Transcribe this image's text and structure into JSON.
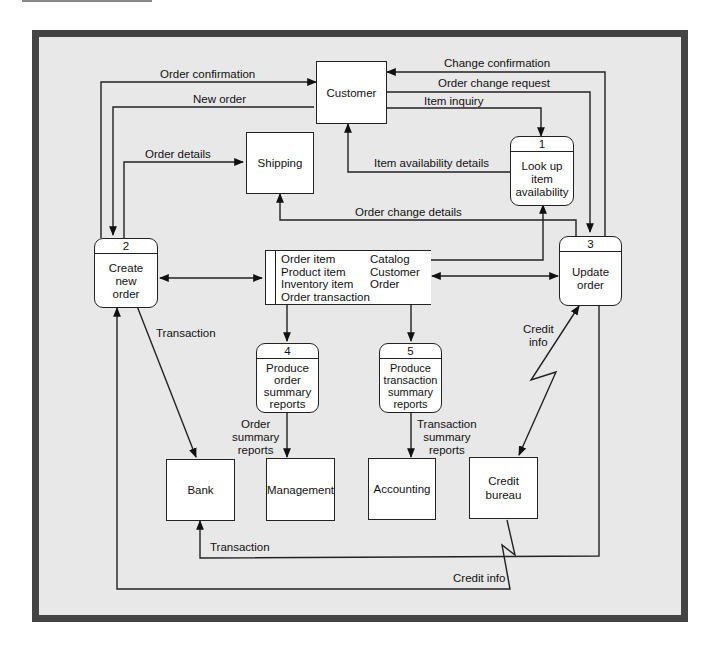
{
  "diagram": {
    "type": "data-flow-diagram",
    "external_entities": [
      {
        "id": "customer",
        "label": "Customer"
      },
      {
        "id": "shipping",
        "label": "Shipping"
      },
      {
        "id": "bank",
        "label": "Bank"
      },
      {
        "id": "management",
        "label": "Management"
      },
      {
        "id": "accounting",
        "label": "Accounting"
      },
      {
        "id": "credit_bureau",
        "label": "Credit bureau",
        "lines": [
          "Credit",
          "bureau"
        ]
      }
    ],
    "processes": [
      {
        "id": "p1",
        "number": "1",
        "label": "Look up item availability",
        "lines": [
          "Look up",
          "item",
          "availability"
        ]
      },
      {
        "id": "p2",
        "number": "2",
        "label": "Create new order",
        "lines": [
          "Create new",
          "order"
        ]
      },
      {
        "id": "p3",
        "number": "3",
        "label": "Update order",
        "lines": [
          "Update",
          "order"
        ]
      },
      {
        "id": "p4",
        "number": "4",
        "label": "Produce order summary reports",
        "lines": [
          "Produce",
          "order",
          "summary",
          "reports"
        ]
      },
      {
        "id": "p5",
        "number": "5",
        "label": "Produce transaction summary reports",
        "lines": [
          "Produce",
          "transaction",
          "summary",
          "reports"
        ]
      }
    ],
    "data_store": {
      "col1": [
        "Order item",
        "Product item",
        "Inventory item",
        "Order transaction"
      ],
      "col2": [
        "Catalog",
        "Customer",
        "Order"
      ]
    },
    "flows": [
      {
        "from": "p2",
        "to": "customer",
        "label": "Order confirmation"
      },
      {
        "from": "customer",
        "to": "p2",
        "label": "New order"
      },
      {
        "from": "p2",
        "to": "shipping",
        "label": "Order details"
      },
      {
        "from": "p3",
        "to": "customer",
        "label": "Change confirmation"
      },
      {
        "from": "customer",
        "to": "p3",
        "label": "Order change request"
      },
      {
        "from": "customer",
        "to": "p1",
        "label": "Item inquiry"
      },
      {
        "from": "p1",
        "to": "customer",
        "label": "Item availability details"
      },
      {
        "from": "p3",
        "to": "shipping",
        "label": "Order change details"
      },
      {
        "from": "data_store",
        "to": "p1",
        "label": ""
      },
      {
        "from": "p2",
        "to": "data_store",
        "label": "",
        "bidirectional": true
      },
      {
        "from": "p3",
        "to": "data_store",
        "label": "",
        "bidirectional": true
      },
      {
        "from": "data_store",
        "to": "p4",
        "label": ""
      },
      {
        "from": "data_store",
        "to": "p5",
        "label": ""
      },
      {
        "from": "p2",
        "to": "bank",
        "label": "Transaction"
      },
      {
        "from": "p4",
        "to": "management",
        "label": "Order summary reports"
      },
      {
        "from": "p5",
        "to": "accounting",
        "label": "Transaction summary reports"
      },
      {
        "from": "p3",
        "to": "credit_bureau",
        "label": "Credit info",
        "bidirectional": true
      },
      {
        "from": "p3",
        "to": "bank",
        "label": "Transaction"
      },
      {
        "from": "credit_bureau",
        "to": "p2",
        "label": "Credit info"
      }
    ]
  },
  "labels": {
    "order_confirmation": "Order confirmation",
    "new_order": "New order",
    "order_details": "Order details",
    "change_confirmation": "Change confirmation",
    "order_change_request": "Order change request",
    "item_inquiry": "Item inquiry",
    "item_availability_details": "Item availability details",
    "order_change_details": "Order change details",
    "transaction_top": "Transaction",
    "order_summary_reports": [
      "Order",
      "summary",
      "reports"
    ],
    "transaction_summary_reports": [
      "Transaction",
      "summary",
      "reports"
    ],
    "credit_info_top": [
      "Credit",
      "info"
    ],
    "transaction_bottom": "Transaction",
    "credit_info_bottom": "Credit info"
  },
  "colors": {
    "frame_border": "#444444",
    "frame_background": "#e8e8e8",
    "node_fill": "#ffffff",
    "stroke": "#222222"
  }
}
